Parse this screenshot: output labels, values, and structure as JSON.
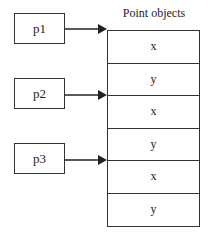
{
  "title": "Point objects",
  "references": [
    {
      "label": "p1",
      "points_to_row": 0
    },
    {
      "label": "p2",
      "points_to_row": 2
    },
    {
      "label": "p3",
      "points_to_row": 4
    }
  ],
  "cells": [
    "x",
    "y",
    "x",
    "y",
    "x",
    "y"
  ],
  "colors": {
    "line": "#333333",
    "background": "#ffffff"
  }
}
